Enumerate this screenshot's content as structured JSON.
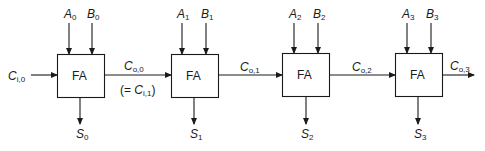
{
  "diagram": {
    "block_label": "FA",
    "line_color": "#1a1a1a",
    "carry_in": {
      "symbol": "C",
      "sub": "i,0"
    },
    "stages": [
      {
        "a": {
          "symbol": "A",
          "sub": "0"
        },
        "b": {
          "symbol": "B",
          "sub": "0"
        },
        "s": {
          "symbol": "S",
          "sub": "0"
        },
        "cout": {
          "symbol": "C",
          "sub": "o,0"
        },
        "note": {
          "prefix": "(= ",
          "symbol": "C",
          "sub": "i,1",
          "suffix": ")"
        }
      },
      {
        "a": {
          "symbol": "A",
          "sub": "1"
        },
        "b": {
          "symbol": "B",
          "sub": "1"
        },
        "s": {
          "symbol": "S",
          "sub": "1"
        },
        "cout": {
          "symbol": "C",
          "sub": "o,1"
        }
      },
      {
        "a": {
          "symbol": "A",
          "sub": "2"
        },
        "b": {
          "symbol": "B",
          "sub": "2"
        },
        "s": {
          "symbol": "S",
          "sub": "2"
        },
        "cout": {
          "symbol": "C",
          "sub": "o,2"
        }
      },
      {
        "a": {
          "symbol": "A",
          "sub": "3"
        },
        "b": {
          "symbol": "B",
          "sub": "3"
        },
        "s": {
          "symbol": "S",
          "sub": "3"
        },
        "cout": {
          "symbol": "C",
          "sub": "o,3"
        }
      }
    ]
  }
}
